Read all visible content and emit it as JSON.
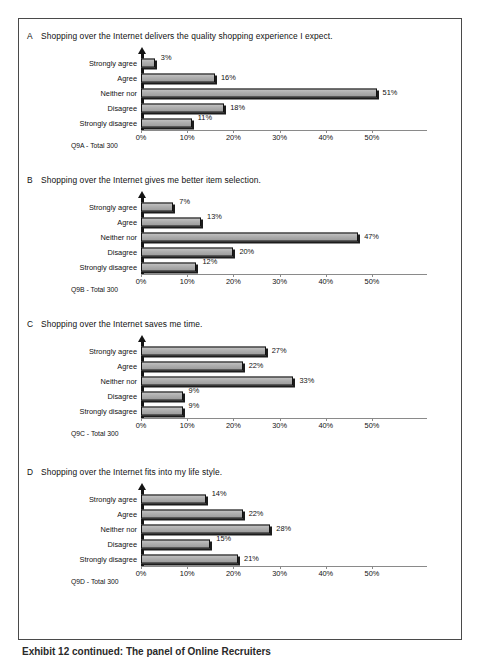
{
  "page": {
    "caption": "Exhibit 12 continued: The panel of Online Recruiters"
  },
  "axis": {
    "tick_labels": [
      "0%",
      "10%",
      "20%",
      "30%",
      "40%",
      "50%"
    ],
    "tick_values": [
      0,
      10,
      20,
      30,
      40,
      50
    ],
    "max": 58
  },
  "categories": [
    "Strongly agree",
    "Agree",
    "Neither nor",
    "Disagree",
    "Strongly disagree"
  ],
  "sections": [
    {
      "letter": "A",
      "title": "Shopping over the Internet delivers the quality shopping experience I expect.",
      "footnote": "Q9A - Total 300"
    },
    {
      "letter": "B",
      "title": "Shopping over the Internet gives me better item selection.",
      "footnote": "Q9B - Total 300"
    },
    {
      "letter": "C",
      "title": "Shopping over the Internet saves me time.",
      "footnote": "Q9C - Total 300"
    },
    {
      "letter": "D",
      "title": "Shopping over the Internet fits into my life style.",
      "footnote": "Q9D - Total 300"
    }
  ],
  "chart_data": [
    {
      "type": "bar",
      "title": "A  Shopping over the Internet delivers the quality shopping experience I expect.",
      "orientation": "horizontal",
      "categories": [
        "Strongly agree",
        "Agree",
        "Neither nor",
        "Disagree",
        "Strongly disagree"
      ],
      "values": [
        3,
        16,
        51,
        18,
        11
      ],
      "labels": [
        "3%",
        "16%",
        "51%",
        "18%",
        "11%"
      ],
      "xlabel": "",
      "ylabel": "",
      "xlim": [
        0,
        58
      ],
      "xticks": [
        0,
        10,
        20,
        30,
        40,
        50
      ],
      "xticklabels": [
        "0%",
        "10%",
        "20%",
        "30%",
        "40%",
        "50%"
      ],
      "grid": false,
      "legend": false,
      "annotation": "Q9A - Total 300"
    },
    {
      "type": "bar",
      "title": "B  Shopping over the Internet gives me better item selection.",
      "orientation": "horizontal",
      "categories": [
        "Strongly agree",
        "Agree",
        "Neither nor",
        "Disagree",
        "Strongly disagree"
      ],
      "values": [
        7,
        13,
        47,
        20,
        12
      ],
      "labels": [
        "7%",
        "13%",
        "47%",
        "20%",
        "12%"
      ],
      "xlabel": "",
      "ylabel": "",
      "xlim": [
        0,
        58
      ],
      "xticks": [
        0,
        10,
        20,
        30,
        40,
        50
      ],
      "xticklabels": [
        "0%",
        "10%",
        "20%",
        "30%",
        "40%",
        "50%"
      ],
      "grid": false,
      "legend": false,
      "annotation": "Q9B - Total 300"
    },
    {
      "type": "bar",
      "title": "C  Shopping over the Internet saves me time.",
      "orientation": "horizontal",
      "categories": [
        "Strongly agree",
        "Agree",
        "Neither nor",
        "Disagree",
        "Strongly disagree"
      ],
      "values": [
        27,
        22,
        33,
        9,
        9
      ],
      "labels": [
        "27%",
        "22%",
        "33%",
        "9%",
        "9%"
      ],
      "xlabel": "",
      "ylabel": "",
      "xlim": [
        0,
        58
      ],
      "xticks": [
        0,
        10,
        20,
        30,
        40,
        50
      ],
      "xticklabels": [
        "0%",
        "10%",
        "20%",
        "30%",
        "40%",
        "50%"
      ],
      "grid": false,
      "legend": false,
      "annotation": "Q9C - Total 300"
    },
    {
      "type": "bar",
      "title": "D  Shopping over the Internet fits into my life style.",
      "orientation": "horizontal",
      "categories": [
        "Strongly agree",
        "Agree",
        "Neither nor",
        "Disagree",
        "Strongly disagree"
      ],
      "values": [
        14,
        22,
        28,
        15,
        21
      ],
      "labels": [
        "14%",
        "22%",
        "28%",
        "15%",
        "21%"
      ],
      "xlabel": "",
      "ylabel": "",
      "xlim": [
        0,
        58
      ],
      "xticks": [
        0,
        10,
        20,
        30,
        40,
        50
      ],
      "xticklabels": [
        "0%",
        "10%",
        "20%",
        "30%",
        "40%",
        "50%"
      ],
      "grid": false,
      "legend": false,
      "annotation": "Q9D - Total 300"
    }
  ]
}
